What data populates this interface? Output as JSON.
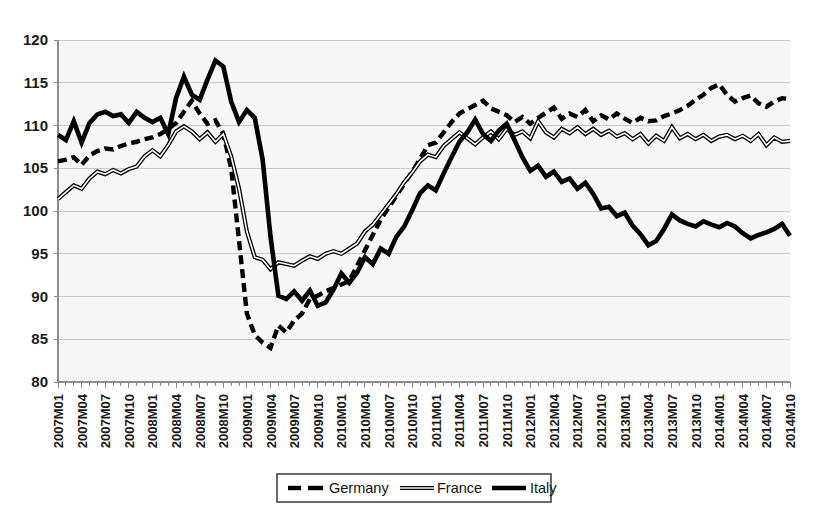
{
  "chart_data": {
    "type": "line",
    "title": "",
    "subtitle": "",
    "xlabel": "",
    "ylabel": "",
    "ylim": [
      80,
      120
    ],
    "ytick_values": [
      80,
      85,
      90,
      95,
      100,
      105,
      110,
      115,
      120
    ],
    "ytick_labels": [
      "80",
      "85",
      "90",
      "95",
      "100",
      "105",
      "110",
      "115",
      "120"
    ],
    "grid": true,
    "legend_position": "bottom-center",
    "x": [
      "2007M01",
      "2007M02",
      "2007M03",
      "2007M04",
      "2007M05",
      "2007M06",
      "2007M07",
      "2007M08",
      "2007M09",
      "2007M10",
      "2007M11",
      "2007M12",
      "2008M01",
      "2008M02",
      "2008M03",
      "2008M04",
      "2008M05",
      "2008M06",
      "2008M07",
      "2008M08",
      "2008M09",
      "2008M10",
      "2008M11",
      "2008M12",
      "2009M01",
      "2009M02",
      "2009M03",
      "2009M04",
      "2009M05",
      "2009M06",
      "2009M07",
      "2009M08",
      "2009M09",
      "2009M10",
      "2009M11",
      "2009M12",
      "2010M01",
      "2010M02",
      "2010M03",
      "2010M04",
      "2010M05",
      "2010M06",
      "2010M07",
      "2010M08",
      "2010M09",
      "2010M10",
      "2010M11",
      "2010M12",
      "2011M01",
      "2011M02",
      "2011M03",
      "2011M04",
      "2011M05",
      "2011M06",
      "2011M07",
      "2011M08",
      "2011M09",
      "2011M10",
      "2011M11",
      "2011M12",
      "2012M01",
      "2012M02",
      "2012M03",
      "2012M04",
      "2012M05",
      "2012M06",
      "2012M07",
      "2012M08",
      "2012M09",
      "2012M10",
      "2012M11",
      "2012M12",
      "2013M01",
      "2013M02",
      "2013M03",
      "2013M04",
      "2013M05",
      "2013M06",
      "2013M07",
      "2013M08",
      "2013M09",
      "2013M10",
      "2013M11",
      "2013M12",
      "2014M01",
      "2014M02",
      "2014M03",
      "2014M04",
      "2014M05",
      "2014M06",
      "2014M07",
      "2014M08",
      "2014M09",
      "2014M10"
    ],
    "xtick_labels_shown": [
      "2007M01",
      "2007M04",
      "2007M07",
      "2007M10",
      "2008M01",
      "2008M04",
      "2008M07",
      "2008M10",
      "2009M01",
      "2009M04",
      "2009M07",
      "2009M10",
      "2010M01",
      "2010M04",
      "2010M07",
      "2010M10",
      "2011M01",
      "2011M04",
      "2011M07",
      "2011M10",
      "2012M01",
      "2012M04",
      "2012M07",
      "2012M10",
      "2013M01",
      "2013M04",
      "2013M07",
      "2013M10",
      "2014M01",
      "2014M04",
      "2014M07",
      "2014M10"
    ],
    "xtick_label_interval": 3,
    "series": [
      {
        "name": "Germany",
        "style": "dashed",
        "color": "#000000",
        "values": [
          105.8,
          106.0,
          106.3,
          105.4,
          106.5,
          107.0,
          107.3,
          107.2,
          107.6,
          107.9,
          108.1,
          108.4,
          108.6,
          109.0,
          109.6,
          110.3,
          111.6,
          112.9,
          111.4,
          110.2,
          110.6,
          109.0,
          105.0,
          96.5,
          88.0,
          85.5,
          84.6,
          84.0,
          86.6,
          85.8,
          87.2,
          88.0,
          89.7,
          90.1,
          90.6,
          91.0,
          91.4,
          91.8,
          93.6,
          95.4,
          97.2,
          99.0,
          100.4,
          101.8,
          103.2,
          104.6,
          106.1,
          107.7,
          108.0,
          109.2,
          110.4,
          111.4,
          111.9,
          112.4,
          112.9,
          112.0,
          111.6,
          111.2,
          110.4,
          111.0,
          110.2,
          110.9,
          111.5,
          112.1,
          110.8,
          111.4,
          111.0,
          111.8,
          110.5,
          111.2,
          110.7,
          111.4,
          110.8,
          110.3,
          110.9,
          110.5,
          110.6,
          111.1,
          111.4,
          111.8,
          112.3,
          113.0,
          113.6,
          114.4,
          114.8,
          113.6,
          112.8,
          113.2,
          113.5,
          112.6,
          112.2,
          112.8,
          113.2,
          113.1
        ]
      },
      {
        "name": "France",
        "style": "thin-outline",
        "color": "#000000",
        "values": [
          101.4,
          102.2,
          103.0,
          102.6,
          103.8,
          104.6,
          104.3,
          104.8,
          104.4,
          104.9,
          105.2,
          106.4,
          107.1,
          106.4,
          107.7,
          109.3,
          109.9,
          109.3,
          108.4,
          109.2,
          108.1,
          109.0,
          106.4,
          102.6,
          97.6,
          94.6,
          94.3,
          93.2,
          94.0,
          93.8,
          93.6,
          94.2,
          94.7,
          94.4,
          95.0,
          95.3,
          95.0,
          95.6,
          96.2,
          97.6,
          98.4,
          99.6,
          100.8,
          102.0,
          103.4,
          104.5,
          105.8,
          106.6,
          106.3,
          107.6,
          108.4,
          109.2,
          108.5,
          107.8,
          108.6,
          109.3,
          108.4,
          109.6,
          108.9,
          109.3,
          108.5,
          110.5,
          109.2,
          108.6,
          109.6,
          109.1,
          109.8,
          109.0,
          109.6,
          108.9,
          109.4,
          108.7,
          109.1,
          108.4,
          109.0,
          107.9,
          108.8,
          108.2,
          109.8,
          108.5,
          109.0,
          108.4,
          108.9,
          108.2,
          108.7,
          108.9,
          108.4,
          108.8,
          108.2,
          109.0,
          107.7,
          108.6,
          108.1,
          108.2
        ]
      },
      {
        "name": "Italy",
        "style": "solid-thick",
        "color": "#000000",
        "values": [
          108.9,
          108.3,
          110.5,
          108.0,
          110.3,
          111.3,
          111.6,
          111.1,
          111.3,
          110.3,
          111.6,
          110.9,
          110.4,
          110.9,
          109.0,
          113.2,
          115.7,
          113.6,
          113.0,
          115.4,
          117.6,
          116.9,
          112.8,
          110.4,
          111.8,
          110.9,
          106.0,
          97.0,
          90.1,
          89.7,
          90.6,
          89.5,
          90.7,
          88.9,
          89.3,
          90.8,
          92.7,
          91.6,
          92.8,
          94.6,
          93.8,
          95.6,
          95.0,
          97.0,
          98.2,
          100.1,
          102.1,
          103.0,
          102.4,
          104.4,
          106.3,
          108.1,
          109.2,
          110.7,
          109.0,
          108.2,
          109.4,
          110.2,
          108.3,
          106.3,
          104.7,
          105.3,
          104.0,
          104.6,
          103.4,
          103.8,
          102.6,
          103.3,
          102.0,
          100.3,
          100.5,
          99.4,
          99.8,
          98.3,
          97.3,
          96.0,
          96.5,
          97.9,
          99.6,
          98.9,
          98.5,
          98.2,
          98.8,
          98.4,
          98.1,
          98.6,
          98.2,
          97.4,
          96.8,
          97.2,
          97.5,
          97.9,
          98.5,
          97.1
        ]
      }
    ]
  },
  "legend": {
    "items": [
      {
        "label": "Germany",
        "marker": "dashed-line-marker"
      },
      {
        "label": "France",
        "marker": "outline-line-marker"
      },
      {
        "label": "Italy",
        "marker": "solid-line-marker"
      }
    ]
  },
  "colors": {
    "plot_background": "#f7f7f7",
    "gridline": "#c9c9c9",
    "axis": "#8d8d8d",
    "text": "#1a1a1a",
    "series": "#000000"
  }
}
